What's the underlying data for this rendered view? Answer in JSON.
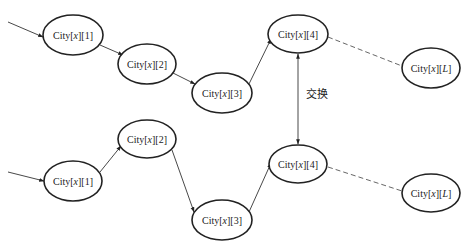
{
  "diagram": {
    "type": "path-swap-illustration",
    "swap_label": "交换",
    "top_path": {
      "nodes": [
        {
          "id": "t1",
          "label_prefix": "City[",
          "var": "x",
          "label_suffix": "][1]",
          "cx": 73,
          "cy": 35
        },
        {
          "id": "t2",
          "label_prefix": "City[",
          "var": "x",
          "label_suffix": "][2]",
          "cx": 147,
          "cy": 64
        },
        {
          "id": "t3",
          "label_prefix": "City[",
          "var": "x",
          "label_suffix": "][3]",
          "cx": 222,
          "cy": 93
        },
        {
          "id": "t4",
          "label_prefix": "City[",
          "var": "x",
          "label_suffix": "][4]",
          "cx": 298,
          "cy": 34
        },
        {
          "id": "tL",
          "label_prefix": "City[",
          "var": "x",
          "label_suffix": "][",
          "var2": "L",
          "label_suffix2": "]",
          "cx": 431,
          "cy": 68
        }
      ]
    },
    "bottom_path": {
      "nodes": [
        {
          "id": "b1",
          "label_prefix": "City[",
          "var": "x",
          "label_suffix": "][1]",
          "cx": 73,
          "cy": 181
        },
        {
          "id": "b2",
          "label_prefix": "City[",
          "var": "x",
          "label_suffix": "][2]",
          "cx": 147,
          "cy": 139
        },
        {
          "id": "b3",
          "label_prefix": "City[",
          "var": "x",
          "label_suffix": "][3]",
          "cx": 222,
          "cy": 220
        },
        {
          "id": "b4",
          "label_prefix": "City[",
          "var": "x",
          "label_suffix": "][4]",
          "cx": 298,
          "cy": 164
        },
        {
          "id": "bL",
          "label_prefix": "City[",
          "var": "x",
          "label_suffix": "][",
          "var2": "L",
          "label_suffix2": "]",
          "cx": 431,
          "cy": 193
        }
      ]
    },
    "edges": [
      {
        "from": "start-top",
        "to": "t1",
        "style": "solid-arrow"
      },
      {
        "from": "t1",
        "to": "t2",
        "style": "solid-arrow"
      },
      {
        "from": "t2",
        "to": "t3",
        "style": "solid-arrow"
      },
      {
        "from": "t3",
        "to": "t4",
        "style": "solid-arrow"
      },
      {
        "from": "t4",
        "to": "tL",
        "style": "dashed"
      },
      {
        "from": "start-bottom",
        "to": "b1",
        "style": "solid-arrow"
      },
      {
        "from": "b1",
        "to": "b2",
        "style": "solid-arrow"
      },
      {
        "from": "b2",
        "to": "b3",
        "style": "solid-arrow"
      },
      {
        "from": "b3",
        "to": "b4",
        "style": "solid-arrow"
      },
      {
        "from": "b4",
        "to": "bL",
        "style": "dashed"
      },
      {
        "from": "t4",
        "to": "b4",
        "style": "double-arrow",
        "label": "交换"
      }
    ]
  }
}
